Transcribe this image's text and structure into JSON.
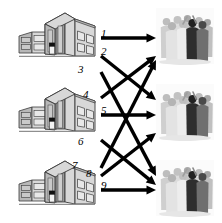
{
  "figure": {
    "type": "bipartite-assignment-diagram",
    "background_color": "#ffffff",
    "arrow_color": "#000000",
    "label_color": "#000000"
  },
  "sources": [
    {
      "id": "building-1",
      "name": "building",
      "index": 1,
      "x": 18,
      "y": 10,
      "w": 78,
      "h": 48
    },
    {
      "id": "building-2",
      "name": "building",
      "index": 2,
      "x": 18,
      "y": 85,
      "w": 78,
      "h": 48
    },
    {
      "id": "building-3",
      "name": "building",
      "index": 3,
      "x": 18,
      "y": 158,
      "w": 78,
      "h": 48
    }
  ],
  "targets": [
    {
      "id": "crowd-1",
      "name": "group-of-people",
      "index": 1,
      "x": 156,
      "y": 8,
      "w": 58,
      "h": 56
    },
    {
      "id": "crowd-2",
      "name": "group-of-people",
      "index": 2,
      "x": 156,
      "y": 84,
      "w": 58,
      "h": 56
    },
    {
      "id": "crowd-3",
      "name": "group-of-people",
      "index": 3,
      "x": 156,
      "y": 160,
      "w": 58,
      "h": 56
    }
  ],
  "edges": [
    {
      "label": "1",
      "from": "building-1",
      "to": "crowd-1",
      "x1": 101,
      "y1": 38,
      "x2": 156,
      "y2": 38,
      "label_x": 101,
      "label_y": 28
    },
    {
      "label": "2",
      "from": "building-1",
      "to": "crowd-2",
      "x1": 101,
      "y1": 56,
      "x2": 156,
      "y2": 100,
      "label_x": 101,
      "label_y": 46
    },
    {
      "label": "3",
      "from": "building-1",
      "to": "crowd-3",
      "x1": 101,
      "y1": 72,
      "x2": 156,
      "y2": 176,
      "label_x": 78,
      "label_y": 64
    },
    {
      "label": "4",
      "from": "building-2",
      "to": "crowd-1",
      "x1": 101,
      "y1": 98,
      "x2": 156,
      "y2": 56,
      "label_x": 83,
      "label_y": 89
    },
    {
      "label": "5",
      "from": "building-2",
      "to": "crowd-2",
      "x1": 101,
      "y1": 115,
      "x2": 156,
      "y2": 115,
      "label_x": 101,
      "label_y": 105
    },
    {
      "label": "6",
      "from": "building-2",
      "to": "crowd-3",
      "x1": 101,
      "y1": 140,
      "x2": 156,
      "y2": 185,
      "label_x": 78,
      "label_y": 136
    },
    {
      "label": "7",
      "from": "building-3",
      "to": "crowd-1",
      "x1": 101,
      "y1": 168,
      "x2": 156,
      "y2": 60,
      "label_x": 72,
      "label_y": 160
    },
    {
      "label": "8",
      "from": "building-3",
      "to": "crowd-2",
      "x1": 101,
      "y1": 176,
      "x2": 156,
      "y2": 133,
      "label_x": 86,
      "label_y": 168
    },
    {
      "label": "9",
      "from": "building-3",
      "to": "crowd-3",
      "x1": 101,
      "y1": 190,
      "x2": 156,
      "y2": 190,
      "label_x": 101,
      "label_y": 180
    }
  ],
  "edge_labels": [
    "1",
    "2",
    "3",
    "4",
    "5",
    "6",
    "7",
    "8",
    "9"
  ]
}
